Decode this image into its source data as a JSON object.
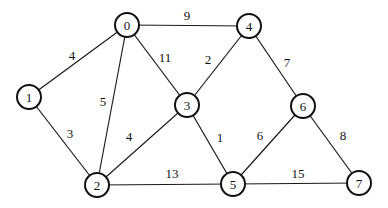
{
  "graph": {
    "type": "undirected-weighted",
    "nodes": [
      {
        "id": "0",
        "label": "0",
        "x": 127,
        "y": 25
      },
      {
        "id": "1",
        "label": "1",
        "x": 29,
        "y": 97
      },
      {
        "id": "2",
        "label": "2",
        "x": 97,
        "y": 185
      },
      {
        "id": "3",
        "label": "3",
        "x": 187,
        "y": 105
      },
      {
        "id": "4",
        "label": "4",
        "x": 249,
        "y": 26
      },
      {
        "id": "5",
        "label": "5",
        "x": 233,
        "y": 184
      },
      {
        "id": "6",
        "label": "6",
        "x": 303,
        "y": 106
      },
      {
        "id": "7",
        "label": "7",
        "x": 359,
        "y": 183
      }
    ],
    "edges": [
      {
        "from": "0",
        "to": "1",
        "weight": "4",
        "lx": 72,
        "ly": 55
      },
      {
        "from": "0",
        "to": "2",
        "weight": "5",
        "lx": 103,
        "ly": 101
      },
      {
        "from": "0",
        "to": "3",
        "weight": "11",
        "lx": 165,
        "ly": 57
      },
      {
        "from": "0",
        "to": "4",
        "weight": "9",
        "lx": 187,
        "ly": 15
      },
      {
        "from": "1",
        "to": "2",
        "weight": "3",
        "lx": 70,
        "ly": 133
      },
      {
        "from": "2",
        "to": "3",
        "weight": "4",
        "lx": 129,
        "ly": 136
      },
      {
        "from": "2",
        "to": "5",
        "weight": "13",
        "lx": 172,
        "ly": 173
      },
      {
        "from": "3",
        "to": "4",
        "weight": "2",
        "lx": 208,
        "ly": 59
      },
      {
        "from": "3",
        "to": "5",
        "weight": "1",
        "lx": 220,
        "ly": 137
      },
      {
        "from": "4",
        "to": "6",
        "weight": "7",
        "lx": 287,
        "ly": 62
      },
      {
        "from": "5",
        "to": "6",
        "weight": "6",
        "lx": 260,
        "ly": 135
      },
      {
        "from": "5",
        "to": "7",
        "weight": "15",
        "lx": 298,
        "ly": 173
      },
      {
        "from": "6",
        "to": "7",
        "weight": "8",
        "lx": 343,
        "ly": 135
      }
    ],
    "node_radius": 12
  }
}
